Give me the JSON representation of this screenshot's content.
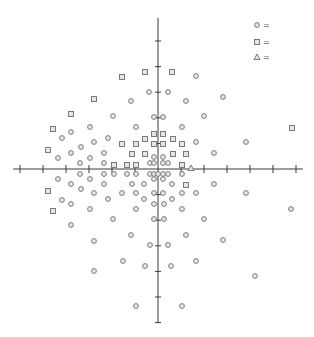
{
  "chart_data": {
    "type": "scatter",
    "title": "",
    "xlabel": "",
    "ylabel": "",
    "grid": false,
    "legend_position": "top-right",
    "axes": {
      "origin_px": [
        158,
        169
      ],
      "x_tick_spacing_px": 23,
      "y_tick_spacing_px": 25.6,
      "x_ticks": [
        -6,
        -5,
        -4,
        -3,
        -2,
        -1,
        1,
        2,
        3,
        4,
        5,
        6
      ],
      "y_ticks": [
        -6,
        -5,
        -4,
        -3,
        -2,
        -1,
        1,
        2,
        3,
        4,
        5
      ],
      "xlim": [
        -6.3,
        6.3
      ],
      "ylim": [
        -6.0,
        5.9
      ]
    },
    "legend": [
      {
        "marker": "circle",
        "label": "="
      },
      {
        "marker": "square",
        "label": "="
      },
      {
        "marker": "triangle",
        "label": "="
      }
    ],
    "series": [
      {
        "name": "circle",
        "marker": "circle",
        "points_px": [
          [
            196,
            76
          ],
          [
            149,
            92
          ],
          [
            168,
            92
          ],
          [
            223,
            97
          ],
          [
            131,
            101
          ],
          [
            186,
            101
          ],
          [
            113,
            116
          ],
          [
            154,
            117
          ],
          [
            163,
            117
          ],
          [
            204,
            116
          ],
          [
            90,
            127
          ],
          [
            136,
            127
          ],
          [
            182,
            127
          ],
          [
            71,
            132
          ],
          [
            62,
            138
          ],
          [
            108,
            138
          ],
          [
            94,
            142
          ],
          [
            196,
            142
          ],
          [
            246,
            142
          ],
          [
            81,
            147
          ],
          [
            71,
            153
          ],
          [
            104,
            153
          ],
          [
            214,
            153
          ],
          [
            58,
            158
          ],
          [
            90,
            158
          ],
          [
            154,
            157
          ],
          [
            163,
            157
          ],
          [
            80,
            163
          ],
          [
            104,
            163
          ],
          [
            150,
            163
          ],
          [
            154,
            163
          ],
          [
            163,
            163
          ],
          [
            168,
            163
          ],
          [
            80,
            174
          ],
          [
            104,
            174
          ],
          [
            114,
            174
          ],
          [
            127,
            174
          ],
          [
            136,
            174
          ],
          [
            150,
            174
          ],
          [
            154,
            174
          ],
          [
            158,
            174
          ],
          [
            163,
            174
          ],
          [
            168,
            174
          ],
          [
            182,
            174
          ],
          [
            58,
            179
          ],
          [
            90,
            179
          ],
          [
            154,
            179
          ],
          [
            163,
            179
          ],
          [
            71,
            184
          ],
          [
            104,
            184
          ],
          [
            132,
            184
          ],
          [
            144,
            184
          ],
          [
            172,
            184
          ],
          [
            214,
            184
          ],
          [
            81,
            189
          ],
          [
            94,
            193
          ],
          [
            122,
            193
          ],
          [
            136,
            193
          ],
          [
            154,
            193
          ],
          [
            163,
            193
          ],
          [
            182,
            193
          ],
          [
            196,
            193
          ],
          [
            246,
            193
          ],
          [
            62,
            200
          ],
          [
            108,
            199
          ],
          [
            144,
            199
          ],
          [
            172,
            199
          ],
          [
            71,
            204
          ],
          [
            154,
            204
          ],
          [
            164,
            204
          ],
          [
            90,
            209
          ],
          [
            136,
            209
          ],
          [
            182,
            209
          ],
          [
            291,
            209
          ],
          [
            113,
            219
          ],
          [
            154,
            219
          ],
          [
            164,
            219
          ],
          [
            204,
            219
          ],
          [
            71,
            225
          ],
          [
            131,
            235
          ],
          [
            186,
            235
          ],
          [
            223,
            240
          ],
          [
            94,
            241
          ],
          [
            150,
            245
          ],
          [
            168,
            245
          ],
          [
            123,
            261
          ],
          [
            196,
            261
          ],
          [
            145,
            266
          ],
          [
            171,
            266
          ],
          [
            94,
            271
          ],
          [
            255,
            276
          ],
          [
            136,
            306
          ],
          [
            182,
            306
          ]
        ]
      },
      {
        "name": "square",
        "marker": "square",
        "points_px": [
          [
            145,
            72
          ],
          [
            172,
            72
          ],
          [
            122,
            77
          ],
          [
            94,
            99
          ],
          [
            71,
            114
          ],
          [
            53,
            129
          ],
          [
            292,
            128
          ],
          [
            154,
            134
          ],
          [
            163,
            134
          ],
          [
            145,
            139
          ],
          [
            173,
            139
          ],
          [
            122,
            144
          ],
          [
            136,
            144
          ],
          [
            154,
            144
          ],
          [
            163,
            144
          ],
          [
            182,
            144
          ],
          [
            48,
            150
          ],
          [
            132,
            154
          ],
          [
            145,
            154
          ],
          [
            173,
            154
          ],
          [
            186,
            154
          ],
          [
            114,
            165
          ],
          [
            127,
            165
          ],
          [
            136,
            165
          ],
          [
            182,
            165
          ],
          [
            186,
            185
          ],
          [
            48,
            191
          ],
          [
            53,
            211
          ]
        ]
      },
      {
        "name": "triangle",
        "marker": "triangle",
        "points_px": [
          [
            191,
            168
          ]
        ]
      }
    ]
  },
  "colors": {
    "axis": "#3a3a3a",
    "marker_stroke": "#7a7a7a",
    "marker_fill": "#e6e6e6",
    "background": "#ffffff"
  }
}
